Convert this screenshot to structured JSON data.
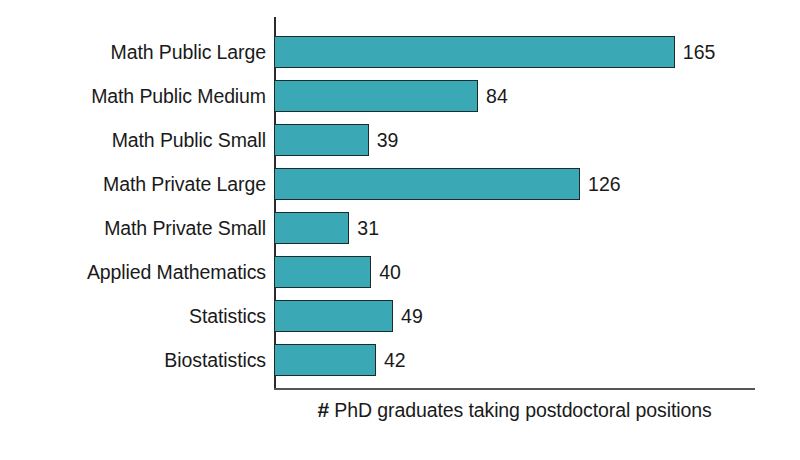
{
  "chart_data": {
    "type": "bar",
    "orientation": "horizontal",
    "title": "",
    "xlabel": "# PhD graduates taking postdoctoral positions",
    "ylabel": "",
    "xlim": [
      0,
      198
    ],
    "grid": false,
    "legend": false,
    "bar_color": "#3aa8b5",
    "bar_edge_color": "#1d2a2e",
    "axis_color": "#2b2b2b",
    "background_color": "#ffffff",
    "categories": [
      "Math Public Large",
      "Math Public Medium",
      "Math Public Small",
      "Math Private Large",
      "Math Private Small",
      "Applied Mathematics",
      "Statistics",
      "Biostatistics"
    ],
    "values": [
      165,
      84,
      39,
      126,
      31,
      40,
      49,
      42
    ],
    "value_labels": [
      "165",
      "84",
      "39",
      "126",
      "31",
      "40",
      "49",
      "42"
    ]
  },
  "axis_caption": {
    "hash": "#",
    "text": " PhD graduates taking postdoctoral positions"
  }
}
